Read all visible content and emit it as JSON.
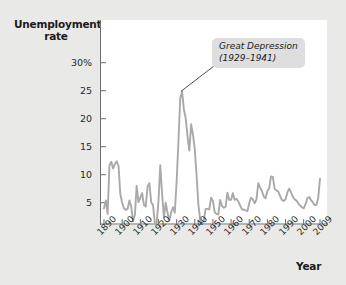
{
  "labels": {
    "y_axis_title_line1": "Unemployment",
    "y_axis_title_line2": "rate",
    "x_axis_title": "Year",
    "annotation_line1": "Great Depression",
    "annotation_line2": "(1929–1941)"
  },
  "colors": {
    "background": "#e9e9e7",
    "plot_background": "#ffffff",
    "line": "#a9a9a9",
    "axis": "#6e6e6e",
    "text": "#1b1b1b",
    "annotation_background": "#dedede"
  },
  "chart_data": {
    "type": "line",
    "title": "",
    "xlabel": "Year",
    "ylabel": "Unemployment rate",
    "xlim": [
      1890,
      2009
    ],
    "ylim": [
      1.2,
      33.0
    ],
    "grid": false,
    "legend": null,
    "ytick_labels": [
      "30%",
      "25",
      "20",
      "15",
      "10",
      "5"
    ],
    "yticks": [
      30,
      25,
      20,
      15,
      10,
      5
    ],
    "xtick_labels": [
      "1890",
      "1900",
      "1910",
      "1920",
      "1930",
      "1940",
      "1950",
      "1960",
      "1970",
      "1980",
      "1990",
      "2000",
      "2009"
    ],
    "xticks": [
      1890,
      1900,
      1910,
      1920,
      1930,
      1940,
      1950,
      1960,
      1970,
      1980,
      1990,
      2000,
      2009
    ],
    "annotations": [
      {
        "text": "Great Depression (1929–1941)",
        "point_x": 1933,
        "point_y": 24.9
      }
    ],
    "series": [
      {
        "name": "Unemployment rate",
        "x": [
          1890,
          1891,
          1892,
          1893,
          1894,
          1895,
          1896,
          1897,
          1898,
          1899,
          1900,
          1901,
          1902,
          1903,
          1904,
          1905,
          1906,
          1907,
          1908,
          1909,
          1910,
          1911,
          1912,
          1913,
          1914,
          1915,
          1916,
          1917,
          1918,
          1919,
          1920,
          1921,
          1922,
          1923,
          1924,
          1925,
          1926,
          1927,
          1928,
          1929,
          1930,
          1931,
          1932,
          1933,
          1934,
          1935,
          1936,
          1937,
          1938,
          1939,
          1940,
          1941,
          1942,
          1943,
          1944,
          1945,
          1946,
          1947,
          1948,
          1949,
          1950,
          1951,
          1952,
          1953,
          1954,
          1955,
          1956,
          1957,
          1958,
          1959,
          1960,
          1961,
          1962,
          1963,
          1964,
          1965,
          1966,
          1967,
          1968,
          1969,
          1970,
          1971,
          1972,
          1973,
          1974,
          1975,
          1976,
          1977,
          1978,
          1979,
          1980,
          1981,
          1982,
          1983,
          1984,
          1985,
          1986,
          1987,
          1988,
          1989,
          1990,
          1991,
          1992,
          1993,
          1994,
          1995,
          1996,
          1997,
          1998,
          1999,
          2000,
          2001,
          2002,
          2003,
          2004,
          2005,
          2006,
          2007,
          2008,
          2009
        ],
        "values": [
          4.0,
          5.4,
          3.0,
          11.7,
          12.3,
          11.1,
          11.9,
          12.4,
          11.6,
          6.5,
          5.0,
          4.0,
          3.7,
          3.9,
          5.4,
          4.3,
          1.7,
          2.8,
          8.0,
          5.1,
          5.9,
          6.7,
          4.6,
          4.3,
          7.9,
          8.5,
          5.1,
          4.6,
          1.4,
          1.4,
          5.2,
          11.7,
          6.7,
          2.4,
          5.0,
          3.2,
          1.8,
          3.3,
          4.2,
          3.2,
          8.7,
          15.9,
          23.6,
          24.9,
          21.7,
          20.1,
          16.9,
          14.3,
          19.0,
          17.2,
          14.6,
          9.9,
          4.7,
          1.9,
          1.2,
          1.9,
          3.9,
          3.9,
          3.8,
          5.9,
          5.3,
          3.3,
          3.0,
          2.9,
          5.5,
          4.4,
          4.1,
          4.3,
          6.8,
          5.5,
          5.5,
          6.7,
          5.5,
          5.7,
          5.2,
          4.5,
          3.8,
          3.8,
          3.6,
          3.5,
          4.9,
          5.9,
          5.6,
          4.9,
          5.6,
          8.5,
          7.7,
          7.1,
          6.1,
          5.8,
          7.1,
          7.6,
          9.7,
          9.6,
          7.5,
          7.2,
          7.0,
          6.2,
          5.5,
          5.3,
          5.6,
          6.8,
          7.5,
          6.9,
          6.1,
          5.6,
          5.4,
          4.9,
          4.5,
          4.2,
          4.0,
          4.7,
          5.8,
          6.0,
          5.5,
          5.1,
          4.6,
          4.6,
          5.8,
          9.3
        ]
      }
    ]
  }
}
